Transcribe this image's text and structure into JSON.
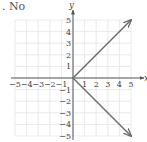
{
  "answer_label": ". No",
  "chart_data": {
    "type": "line",
    "title": "",
    "xlabel": "x",
    "ylabel": "y",
    "xlim": [
      -5,
      5
    ],
    "ylim": [
      -5,
      5
    ],
    "grid": true,
    "xticks": [
      -5,
      -4,
      -3,
      -2,
      -1,
      1,
      2,
      3,
      4,
      5
    ],
    "yticks": [
      -5,
      -4,
      -3,
      -2,
      -1,
      1,
      2,
      3,
      4,
      5
    ],
    "series": [
      {
        "name": "upper ray",
        "x": [
          0,
          5
        ],
        "y": [
          0,
          5
        ],
        "arrow_end": true
      },
      {
        "name": "lower ray",
        "x": [
          0,
          5
        ],
        "y": [
          0,
          -5
        ],
        "arrow_end": true
      }
    ],
    "colors": {
      "line": "#6b6b6b",
      "axis": "#555555",
      "grid": "#e4e4e4"
    }
  }
}
